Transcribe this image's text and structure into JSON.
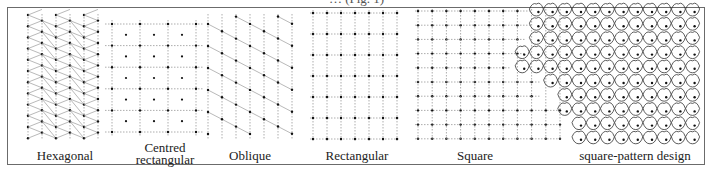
{
  "figure": {
    "caption_partial": "… (Fig. 1)",
    "panels": [
      {
        "id": "hexagonal",
        "label": "Hexagonal"
      },
      {
        "id": "centred-rectangular",
        "label_line1": "Centred",
        "label_line2": "rectangular"
      },
      {
        "id": "oblique",
        "label": "Oblique"
      },
      {
        "id": "rectangular",
        "label": "Rectangular"
      },
      {
        "id": "square",
        "label": "Square"
      },
      {
        "id": "square-pattern-design",
        "label": "square-pattern design"
      }
    ],
    "colors": {
      "lines": "#8a8a8a",
      "dots": "#111111",
      "frame": "#6b6b6b",
      "text": "#222222"
    }
  }
}
